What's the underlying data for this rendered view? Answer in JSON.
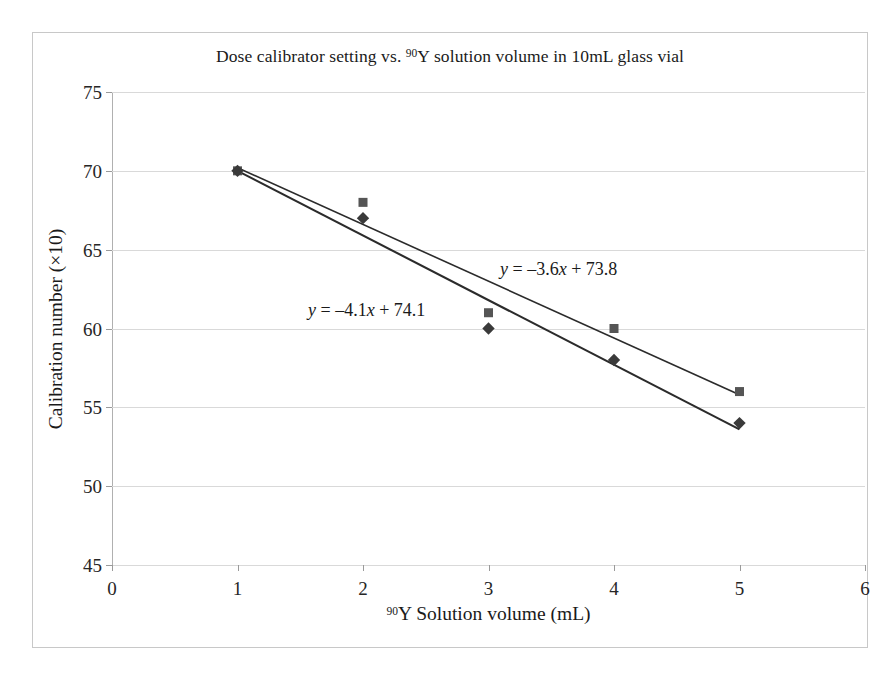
{
  "chart_data": {
    "type": "scatter",
    "title": "Dose calibrator setting vs. 90Y solution volume in 10mL glass vial",
    "title_parts": {
      "before_sup": "Dose calibrator setting vs. ",
      "sup": "90",
      "after_sup": "Y solution volume in 10mL glass vial"
    },
    "xlabel": "90Y Solution volume (mL)",
    "xlabel_parts": {
      "sup": "90",
      "after_sup": "Y Solution volume (mL)"
    },
    "ylabel": "Calibration number (×10)",
    "xlim": [
      0,
      6
    ],
    "ylim": [
      45,
      75
    ],
    "xticks": [
      "0",
      "1",
      "2",
      "3",
      "4",
      "5",
      "6"
    ],
    "yticks": [
      "45",
      "50",
      "55",
      "60",
      "65",
      "70",
      "75"
    ],
    "grid": "horizontal",
    "legend": "none",
    "x": [
      1,
      2,
      3,
      4,
      5
    ],
    "series": [
      {
        "name": "series-squares",
        "marker": "square",
        "color": "#555555",
        "values": [
          70,
          68,
          61,
          60,
          56
        ],
        "trendline": {
          "slope": -3.6,
          "intercept": 73.8,
          "equation": "y = –3.6x + 73.8",
          "equation_parts": {
            "var_y": "y",
            "eq": " = –3.6",
            "var_x": "x",
            "tail": " + 73.8"
          },
          "x_start": 1,
          "x_end": 5
        }
      },
      {
        "name": "series-diamonds",
        "marker": "diamond",
        "color": "#3a3a3a",
        "values": [
          70,
          67,
          60,
          58,
          54
        ],
        "trendline": {
          "slope": -4.1,
          "intercept": 74.1,
          "equation": "y = –4.1x + 74.1",
          "equation_parts": {
            "var_y": "y",
            "eq": " = –4.1",
            "var_x": "x",
            "tail": " + 74.1"
          },
          "x_start": 1,
          "x_end": 5
        }
      }
    ],
    "annotations": [
      {
        "text": "y = –3.6x + 73.8",
        "refers_to": "series-squares"
      },
      {
        "text": "y = –4.1x + 74.1",
        "refers_to": "series-diamonds"
      }
    ],
    "colors": {
      "gridline": "#d9d9d9",
      "axis": "#b0b0b0",
      "frame": "#c8c8c8",
      "text": "#1a1a1a",
      "background": "#ffffff"
    }
  }
}
